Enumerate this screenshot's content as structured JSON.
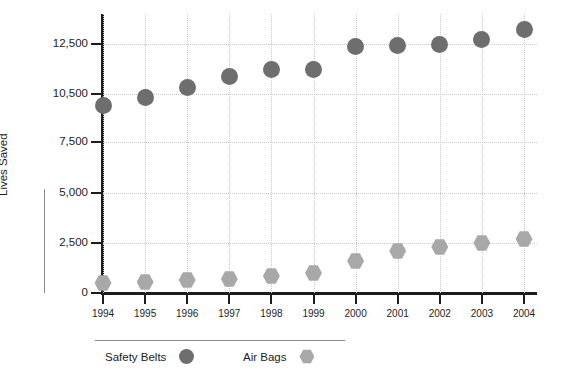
{
  "chart_data": {
    "type": "scatter",
    "title": "",
    "xlabel": "",
    "ylabel": "Lives Saved",
    "categories": [
      "1994",
      "1995",
      "1996",
      "1997",
      "1998",
      "1999",
      "2000",
      "2001",
      "2002",
      "2003",
      "2004"
    ],
    "series": [
      {
        "name": "Safety Belts",
        "marker": "circle",
        "color": "#6e6e6e",
        "values": [
          9800,
          10300,
          10750,
          11200,
          11500,
          11500,
          12400,
          12450,
          12500,
          12700,
          13100
        ]
      },
      {
        "name": "Air Bags",
        "marker": "hexagon",
        "color": "#a8a8a8",
        "values": [
          500,
          550,
          650,
          700,
          850,
          1000,
          1600,
          2100,
          2300,
          2500,
          2700
        ]
      }
    ],
    "y_ticks": [
      "0",
      "2,500",
      "5,000",
      "7,500",
      "10,500",
      "12,500"
    ],
    "y_tick_values": [
      0,
      2500,
      5000,
      7500,
      10500,
      12500
    ],
    "ylim": [
      0,
      13600
    ],
    "grid": true,
    "legend_position": "bottom-left"
  },
  "axis": {
    "y_title": "Lives Saved"
  },
  "legend": {
    "items": [
      {
        "label": "Safety Belts",
        "marker": "circle"
      },
      {
        "label": "Air Bags",
        "marker": "hexagon"
      }
    ]
  }
}
